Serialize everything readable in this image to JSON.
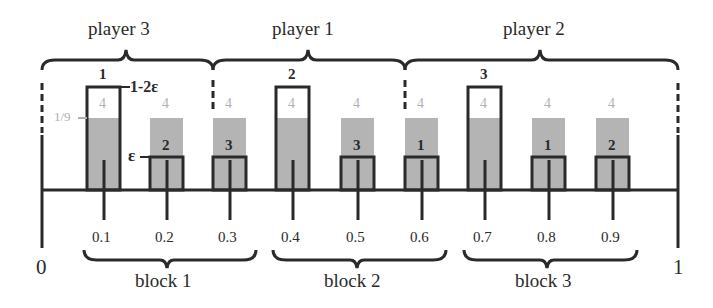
{
  "diagram": {
    "colors": {
      "ink": "#2a2a2a",
      "shade": "#b4b4b4",
      "faint_text": "#b0b0b0",
      "background": "#ffffff"
    },
    "axis": {
      "start_label": "0",
      "end_label": "1",
      "ticks": [
        "0.1",
        "0.2",
        "0.3",
        "0.4",
        "0.5",
        "0.6",
        "0.7",
        "0.8",
        "0.9"
      ]
    },
    "players": [
      {
        "label": "player 3"
      },
      {
        "label": "player 1"
      },
      {
        "label": "player 2"
      }
    ],
    "blocks": [
      {
        "label": "block 1"
      },
      {
        "label": "block 2"
      },
      {
        "label": "block 3"
      }
    ],
    "bars": [
      {
        "position": "0.1",
        "top_label": "1",
        "shade_label": "4",
        "type": "tall"
      },
      {
        "position": "0.2",
        "top_label": "2",
        "shade_label": "4",
        "type": "short"
      },
      {
        "position": "0.3",
        "top_label": "3",
        "shade_label": "4",
        "type": "short"
      },
      {
        "position": "0.4",
        "top_label": "2",
        "shade_label": "4",
        "type": "tall"
      },
      {
        "position": "0.5",
        "top_label": "3",
        "shade_label": "4",
        "type": "short"
      },
      {
        "position": "0.6",
        "top_label": "1",
        "shade_label": "4",
        "type": "short"
      },
      {
        "position": "0.7",
        "top_label": "3",
        "shade_label": "4",
        "type": "tall"
      },
      {
        "position": "0.8",
        "top_label": "1",
        "shade_label": "4",
        "type": "short"
      },
      {
        "position": "0.9",
        "top_label": "2",
        "shade_label": "4",
        "type": "short"
      }
    ],
    "annotations": {
      "tall_height": "1-2ε",
      "short_height": "ε",
      "shade_height": "1/9"
    }
  }
}
